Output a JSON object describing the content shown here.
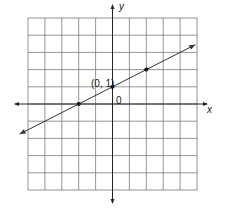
{
  "chart_data": {
    "type": "line",
    "title": "",
    "xlabel": "x",
    "ylabel": "y",
    "xlim": [
      -5,
      5
    ],
    "ylim": [
      -5,
      5
    ],
    "grid": true,
    "grid_step": 1,
    "series": [
      {
        "name": "line",
        "equation": "y = x/2 + 1",
        "slope": 0.5,
        "intercept": 1,
        "x": [
          -5.5,
          4.9
        ],
        "y": [
          -1.75,
          3.45
        ]
      }
    ],
    "points": [
      {
        "x": -2,
        "y": 0
      },
      {
        "x": 0,
        "y": 1
      },
      {
        "x": 2,
        "y": 2
      }
    ],
    "annotations": [
      {
        "text": "(0, 1)",
        "x": 0,
        "y": 1
      },
      {
        "text": "0",
        "x": 0,
        "y": 0
      }
    ]
  },
  "labels": {
    "x_axis": "x",
    "y_axis": "y",
    "point_label": "(0, 1)",
    "origin_label": "0"
  },
  "colors": {
    "grid": "#7a7a7a",
    "axis": "#222222",
    "line": "#333333",
    "point": "#111111"
  }
}
